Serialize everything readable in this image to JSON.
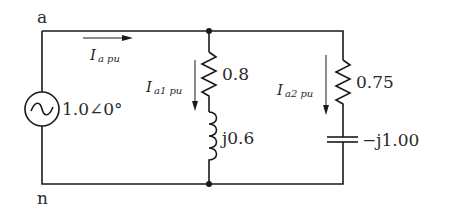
{
  "diagram": {
    "type": "ac-circuit",
    "nodes": {
      "top": "a",
      "bottom": "n"
    },
    "source": {
      "label": "1.0∠0°",
      "kind": "ac-voltage-source"
    },
    "currents": {
      "total": {
        "main": "I",
        "sub": "a pu"
      },
      "branch1": {
        "main": "I",
        "sub": "a1 pu"
      },
      "branch2": {
        "main": "I",
        "sub": "a2 pu"
      }
    },
    "branch1": {
      "resistor": "0.8",
      "inductor": "j0.6"
    },
    "branch2": {
      "resistor": "0.75",
      "capacitor": "−j1.00"
    }
  }
}
